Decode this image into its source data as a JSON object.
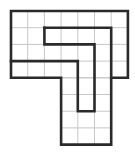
{
  "diagram": {
    "type": "grid-dissection-puzzle",
    "grid": {
      "cols": 7,
      "rows": 8,
      "cell_size": 16.7,
      "origin": [
        11,
        11
      ]
    },
    "colors": {
      "grid": "#c8c8c8",
      "outline": "#2a2a2a",
      "background": "#ffffff"
    },
    "outline": [
      [
        0,
        0
      ],
      [
        7,
        0
      ],
      [
        7,
        4
      ],
      [
        6,
        4
      ],
      [
        6,
        8
      ],
      [
        3,
        8
      ],
      [
        3,
        4
      ],
      [
        0,
        4
      ]
    ],
    "cells_rows_0_3": {
      "col_start": 0,
      "col_end": 7
    },
    "cells_rows_4_7": {
      "col_start": 3,
      "col_end": 6
    },
    "inner_cuts": [
      [
        [
          2,
          1
        ],
        [
          6,
          1
        ],
        [
          6,
          4
        ]
      ],
      [
        [
          2,
          1
        ],
        [
          2,
          2
        ],
        [
          5,
          2
        ],
        [
          5,
          6
        ],
        [
          4,
          6
        ],
        [
          4,
          3
        ],
        [
          0,
          3
        ]
      ]
    ]
  }
}
